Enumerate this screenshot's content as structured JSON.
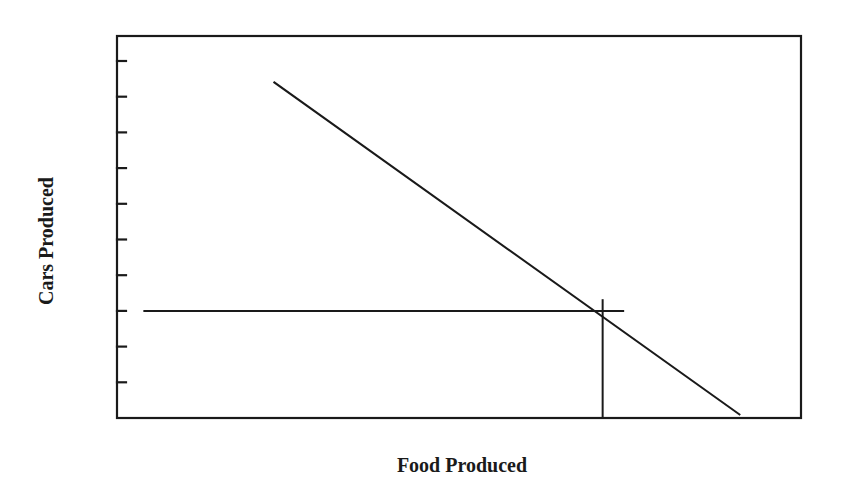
{
  "chart_data": {
    "type": "line",
    "title": "",
    "xlabel": "Food Produced",
    "ylabel": "Cars Produced",
    "x_ticks_visible": false,
    "y_tick_count": 10,
    "y_tick_labels": [],
    "xlim": [
      0,
      10
    ],
    "ylim": [
      0,
      10.7
    ],
    "grid": false,
    "legend": null,
    "series": [
      {
        "name": "Production Possibilities Frontier",
        "x": [
          2.3,
          9.1
        ],
        "y": [
          9.4,
          0.1
        ]
      }
    ],
    "annotations": [
      {
        "type": "point",
        "label": "",
        "x": 7.1,
        "y": 3.0,
        "guides": {
          "horizontal_from_x": 0.4,
          "horizontal_to_x": 7.4,
          "vertical_from_y": 0.0,
          "vertical_to_y": 3.3
        }
      }
    ]
  },
  "colors": {
    "line": "#1a1a1a",
    "background": "#ffffff"
  }
}
